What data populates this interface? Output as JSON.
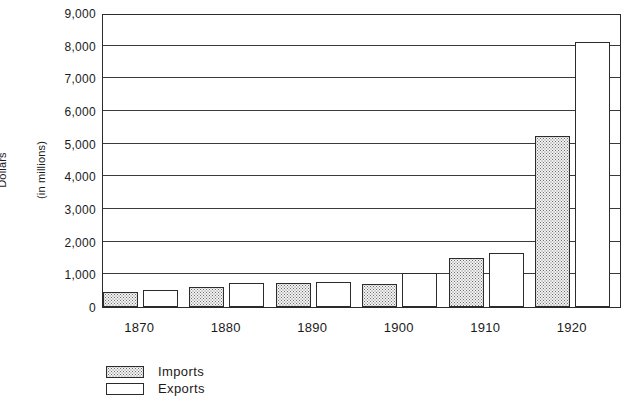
{
  "chart_data": {
    "type": "bar",
    "title": "",
    "xlabel": "",
    "ylabel": "Dollars\n(in millions)",
    "ylabel_lines": [
      "Dollars",
      "(in millions)"
    ],
    "categories": [
      "1870",
      "1880",
      "1890",
      "1900",
      "1910",
      "1920"
    ],
    "series": [
      {
        "name": "Imports",
        "fill": "stippled",
        "values": [
          450,
          600,
          740,
          700,
          1500,
          5250
        ]
      },
      {
        "name": "Exports",
        "fill": "white",
        "values": [
          520,
          750,
          760,
          1050,
          1650,
          8100
        ]
      }
    ],
    "ylim": [
      0,
      9000
    ],
    "yticks": [
      0,
      1000,
      2000,
      3000,
      4000,
      5000,
      6000,
      7000,
      8000,
      9000
    ],
    "ytick_labels": [
      "0",
      "1,000",
      "2,000",
      "3,000",
      "4,000",
      "5,000",
      "6,000",
      "7,000",
      "8,000",
      "9,000"
    ],
    "grid": true,
    "grid_axis": "y",
    "legend_position": "bottom-left",
    "legend_entries": [
      "Imports",
      "Exports"
    ],
    "colors": {
      "axis": "#2b2b2b",
      "grid": "#3a3a3a",
      "imports_fill": "#f2f2f2",
      "imports_dots": "#6e6e6e",
      "exports_fill": "#ffffff",
      "background": "#ffffff"
    }
  }
}
